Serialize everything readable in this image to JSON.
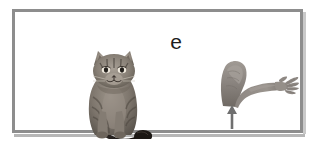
{
  "figure": {
    "panel_label": "e",
    "background_color": "#ffffff",
    "frame_color": "#8d8d8d",
    "frame_shadow_color": "#b6b6b6"
  },
  "items": {
    "cat": {
      "name": "sitting tabby cat photo",
      "description": "grayscale photograph of a tabby cat sitting upright facing forward with dark curled tail to the right",
      "fur_color": "#8a8279",
      "tail_color": "#241f1c"
    },
    "arm": {
      "name": "flexed human arm photo",
      "description": "grayscale photograph of a bent human arm, bicep up, forearm extended to the right with open splayed fingers",
      "skin_color": "#8f8a85"
    },
    "arrow": {
      "name": "upward pointing arrow",
      "description": "thin vertical arrow pointing up at the elbow of the arm",
      "color": "#6f6f6f"
    }
  }
}
